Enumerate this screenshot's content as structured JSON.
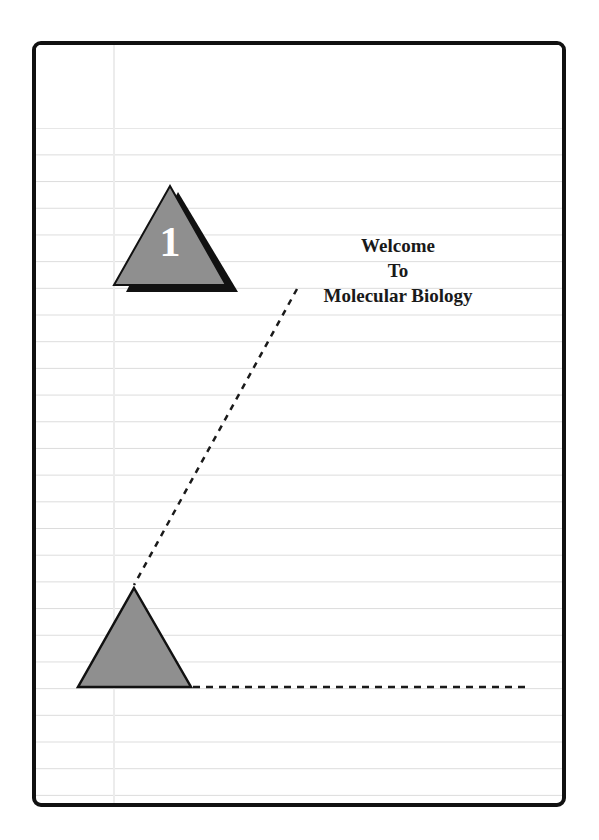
{
  "slide": {
    "number_badge": "1",
    "title_lines": [
      "Welcome",
      "To",
      "Molecular Biology"
    ]
  },
  "colors": {
    "border": "#111111",
    "triangle_fill": "#8f8f8f",
    "shadow": "#111111",
    "ruled_line": "#dcdcdc",
    "dash": "#1a1a1a"
  }
}
